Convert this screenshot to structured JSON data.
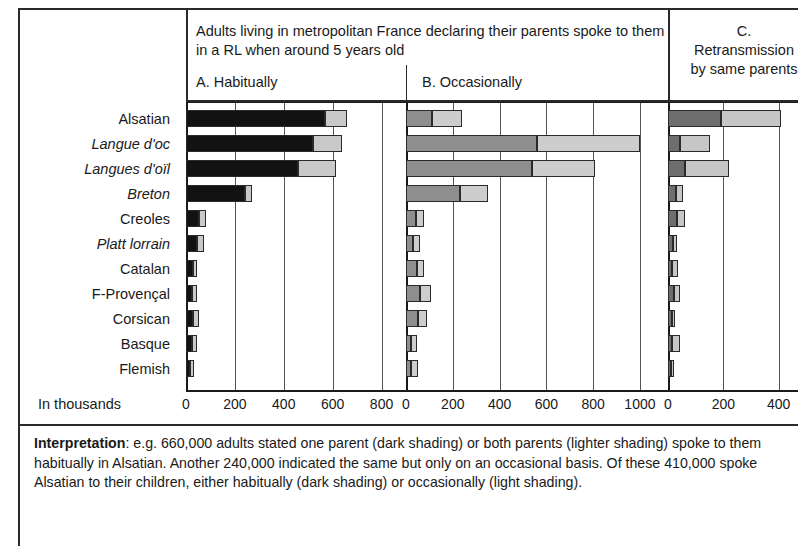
{
  "header": {
    "main_text": "Adults living in metropolitan France declaring their parents spoke to them in a RL when around 5 years old",
    "panel_a_title": "A. Habitually",
    "panel_b_title": "B. Occasionally",
    "panel_c_title": "C.\nRetransmission\nby same parents",
    "panel_c_line1": "C.",
    "panel_c_line2": "Retransmission",
    "panel_c_line3": "by same parents"
  },
  "axis_caption": "In thousands",
  "interpretation": {
    "label": "Interpretation",
    "text": ": e.g. 660,000 adults stated one parent (dark shading) or both parents (lighter shading) spoke to them habitually in Alsatian. Another 240,000 indicated the same but only on an occasional basis. Of these 410,000 spoke Alsatian to their children, either habitually (dark shading) or occasionally (light shading)."
  },
  "colors": {
    "panel_a_dark": "#121212",
    "panel_a_light": "#c9c9c9",
    "panel_b_dark": "#8e8e8e",
    "panel_b_light": "#cdcdcd",
    "panel_c_dark": "#6e6e6e",
    "panel_c_light": "#c6c6c6",
    "frame": "#2a2a2a"
  },
  "chart_data": {
    "type": "bar",
    "orientation": "horizontal",
    "stacked": true,
    "title": "Adults living in metropolitan France declaring their parents spoke to them in a RL when around 5 years old",
    "xlabel": "In thousands",
    "ylabel": "",
    "grid": true,
    "legend_position": "none",
    "categories": [
      "Alsatian",
      "Langue d'oc",
      "Langues d'oïl",
      "Breton",
      "Creoles",
      "Platt lorrain",
      "Catalan",
      "F-Provençal",
      "Corsican",
      "Basque",
      "Flemish"
    ],
    "categories_italic": [
      false,
      true,
      true,
      true,
      false,
      true,
      false,
      false,
      false,
      false,
      false
    ],
    "panels": [
      {
        "id": "A",
        "title": "A. Habitually",
        "xlim": [
          0,
          900
        ],
        "ticks": [
          0,
          200,
          400,
          600,
          800
        ],
        "tick_labels": [
          "0",
          "200",
          "400",
          "600",
          "800"
        ],
        "series": [
          {
            "name": "one parent (dark shading)",
            "shade": "dark",
            "values": [
              570,
              520,
              460,
              240,
              55,
              45,
              28,
              25,
              30,
              26,
              18
            ]
          },
          {
            "name": "both parents (lighter shading)",
            "shade": "light",
            "values": [
              90,
              120,
              155,
              30,
              25,
              28,
              18,
              20,
              22,
              20,
              14
            ]
          }
        ],
        "totals": [
          660,
          640,
          615,
          270,
          80,
          73,
          46,
          45,
          52,
          46,
          32
        ]
      },
      {
        "id": "B",
        "title": "B. Occasionally",
        "xlim": [
          0,
          1120
        ],
        "ticks": [
          0,
          200,
          400,
          600,
          800,
          1000
        ],
        "tick_labels": [
          "0",
          "200",
          "400",
          "600",
          "800",
          "1000"
        ],
        "series": [
          {
            "name": "one parent (dark shading)",
            "shade": "dark",
            "values": [
              110,
              560,
              540,
              230,
              42,
              30,
              48,
              60,
              50,
              20,
              22
            ]
          },
          {
            "name": "both parents (lighter shading)",
            "shade": "light",
            "values": [
              130,
              440,
              270,
              120,
              35,
              28,
              30,
              45,
              38,
              25,
              28
            ]
          }
        ],
        "totals": [
          240,
          1000,
          810,
          350,
          77,
          58,
          78,
          105,
          88,
          45,
          50
        ]
      },
      {
        "id": "C",
        "title": "C. Retransmission by same parents",
        "xlim": [
          0,
          470
        ],
        "ticks": [
          0,
          200,
          400
        ],
        "tick_labels": [
          "0",
          "200",
          "400"
        ],
        "series": [
          {
            "name": "habitually (dark shading)",
            "shade": "dark",
            "values": [
              190,
              42,
              60,
              30,
              32,
              18,
              14,
              20,
              14,
              16,
              10
            ]
          },
          {
            "name": "occasionally (light shading)",
            "shade": "light",
            "values": [
              220,
              110,
              160,
              26,
              30,
              16,
              22,
              25,
              12,
              28,
              6
            ]
          }
        ],
        "totals": [
          410,
          152,
          220,
          56,
          62,
          34,
          36,
          45,
          26,
          44,
          16
        ]
      }
    ]
  }
}
